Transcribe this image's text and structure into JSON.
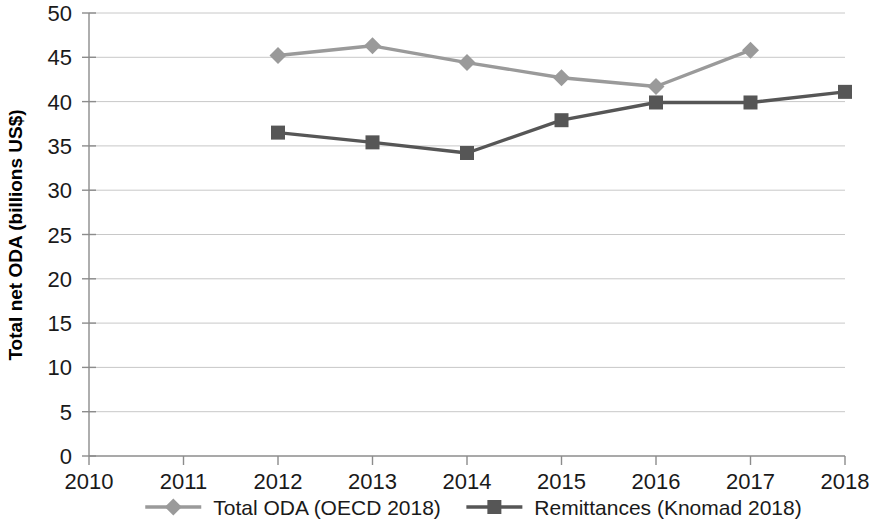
{
  "chart_data": {
    "type": "line",
    "title": "",
    "subtitle": "",
    "xlabel": "",
    "ylabel": "Total net ODA (billions US$)",
    "x": [
      2010,
      2011,
      2012,
      2013,
      2014,
      2015,
      2016,
      2017,
      2018
    ],
    "xtick_labels": [
      "2010",
      "2011",
      "2012",
      "2013",
      "2014",
      "2015",
      "2016",
      "2017",
      "2018"
    ],
    "ytick_labels": [
      "0",
      "5",
      "10",
      "15",
      "20",
      "25",
      "30",
      "35",
      "40",
      "45",
      "50"
    ],
    "yticks": [
      0,
      5,
      10,
      15,
      20,
      25,
      30,
      35,
      40,
      45,
      50
    ],
    "xlim": [
      2010,
      2018
    ],
    "ylim": [
      0,
      50
    ],
    "grid": true,
    "legend_position": "bottom",
    "series": [
      {
        "name": "Total ODA (OECD 2018)",
        "color": "#9a9a9a",
        "marker": "diamond",
        "x": [
          2012,
          2013,
          2014,
          2015,
          2016,
          2017
        ],
        "values": [
          45.2,
          46.3,
          44.4,
          42.7,
          41.7,
          45.8
        ]
      },
      {
        "name": "Remittances (Knomad 2018)",
        "color": "#565656",
        "marker": "square",
        "x": [
          2012,
          2013,
          2014,
          2015,
          2016,
          2017,
          2018
        ],
        "values": [
          36.5,
          35.4,
          34.2,
          37.9,
          39.9,
          39.9,
          41.1
        ]
      }
    ]
  },
  "legend": {
    "items": [
      {
        "label": "Total ODA (OECD 2018)",
        "color": "#9a9a9a",
        "marker": "diamond"
      },
      {
        "label": "Remittances (Knomad 2018)",
        "color": "#565656",
        "marker": "square"
      }
    ]
  },
  "axis": {
    "y_title": "Total net ODA (billions US$)"
  }
}
